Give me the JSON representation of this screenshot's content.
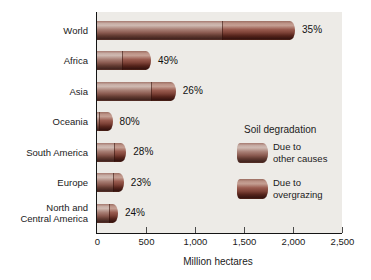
{
  "chart_data": {
    "type": "bar",
    "orientation": "horizontal",
    "title": "",
    "xlabel": "Million hectares",
    "xlim": [
      0,
      2500
    ],
    "grid": false,
    "xticks": [
      {
        "value": 0,
        "label": "0"
      },
      {
        "value": 500,
        "label": "500"
      },
      {
        "value": 1000,
        "label": "1,000"
      },
      {
        "value": 1500,
        "label": "1,500"
      },
      {
        "value": 2000,
        "label": "2,000"
      },
      {
        "value": 2500,
        "label": "2,500"
      }
    ],
    "categories": [
      "World",
      "Africa",
      "Asia",
      "Oceania",
      "South America",
      "Europe",
      "North and\nCentral America"
    ],
    "totals_mha": [
      1965,
      494,
      748,
      103,
      243,
      218,
      158
    ],
    "percent_labels": [
      "35%",
      "49%",
      "26%",
      "80%",
      "28%",
      "23%",
      "24%"
    ],
    "series": [
      {
        "name": "Due to other causes",
        "values": [
          1277,
          252,
          554,
          21,
          175,
          168,
          120
        ]
      },
      {
        "name": "Due to overgrazing",
        "values": [
          688,
          242,
          194,
          82,
          68,
          50,
          38
        ]
      }
    ],
    "legend": {
      "position": "inside right",
      "title": "Soil degradation",
      "items": [
        {
          "label": "Due to\nother causes"
        },
        {
          "label": "Due to\novergrazing"
        }
      ]
    },
    "colors": {
      "panel_background": "#edebe7",
      "other_causes_mid": "#9b6f66",
      "overgrazing_mid": "#8a5348",
      "axis": "#141414"
    }
  }
}
